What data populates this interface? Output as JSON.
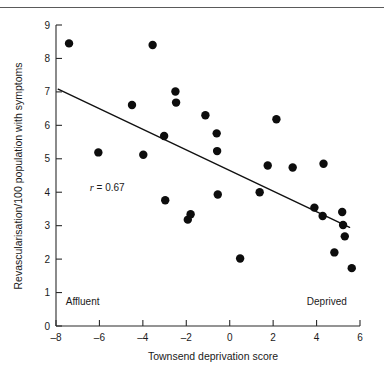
{
  "figure": {
    "background_color": "#ffffff",
    "ink_color": "#1a1a1a"
  },
  "chart_data": {
    "type": "scatter",
    "title": "",
    "xlabel": "Townsend deprivation score",
    "ylabel": "Revascularisation/100 population with symptoms",
    "xlim": [
      -8,
      6
    ],
    "ylim": [
      0,
      9
    ],
    "xticks": [
      -8,
      -6,
      -4,
      -2,
      0,
      2,
      4,
      6
    ],
    "xtick_labels": [
      "–8",
      "–6",
      "–4",
      "–2",
      "0",
      "2",
      "4",
      "6"
    ],
    "yticks": [
      0,
      1,
      2,
      3,
      4,
      5,
      6,
      7,
      8,
      9
    ],
    "ytick_labels": [
      "0",
      "1",
      "2",
      "3",
      "4",
      "5",
      "6",
      "7",
      "8",
      "9"
    ],
    "grid": false,
    "legend": null,
    "marker": {
      "shape": "circle",
      "color": "#0d0d0d",
      "size": 4.2
    },
    "points": [
      {
        "x": -7.4,
        "y": 8.45
      },
      {
        "x": -6.05,
        "y": 5.19
      },
      {
        "x": -4.5,
        "y": 6.61
      },
      {
        "x": -3.98,
        "y": 5.12
      },
      {
        "x": -3.55,
        "y": 8.4
      },
      {
        "x": -3.02,
        "y": 5.68
      },
      {
        "x": -2.97,
        "y": 3.76
      },
      {
        "x": -2.5,
        "y": 7.01
      },
      {
        "x": -2.47,
        "y": 6.68
      },
      {
        "x": -1.93,
        "y": 3.18
      },
      {
        "x": -1.8,
        "y": 3.34
      },
      {
        "x": -1.12,
        "y": 6.3
      },
      {
        "x": -0.6,
        "y": 5.76
      },
      {
        "x": -0.58,
        "y": 5.23
      },
      {
        "x": -0.55,
        "y": 3.93
      },
      {
        "x": 0.48,
        "y": 2.02
      },
      {
        "x": 1.38,
        "y": 4.0
      },
      {
        "x": 1.75,
        "y": 4.8
      },
      {
        "x": 2.15,
        "y": 6.18
      },
      {
        "x": 2.9,
        "y": 4.74
      },
      {
        "x": 3.9,
        "y": 3.54
      },
      {
        "x": 4.28,
        "y": 3.29
      },
      {
        "x": 4.32,
        "y": 4.85
      },
      {
        "x": 4.82,
        "y": 2.2
      },
      {
        "x": 5.18,
        "y": 3.41
      },
      {
        "x": 5.22,
        "y": 3.02
      },
      {
        "x": 5.3,
        "y": 2.68
      },
      {
        "x": 5.62,
        "y": 1.73
      }
    ],
    "fit_line": {
      "label": "regression line",
      "x_start": -7.9,
      "y_start": 7.08,
      "x_end": 5.52,
      "y_end": 2.95
    },
    "annotations": [
      {
        "name": "correlation",
        "symbol": "r",
        "text": " = 0.67",
        "x": -6.45,
        "y": 4.05
      },
      {
        "name": "affluent-label",
        "text": "Affluent",
        "x": -7.55,
        "y": 0.62
      },
      {
        "name": "deprived-label",
        "text": "Deprived",
        "x": 3.55,
        "y": 0.62
      }
    ]
  }
}
